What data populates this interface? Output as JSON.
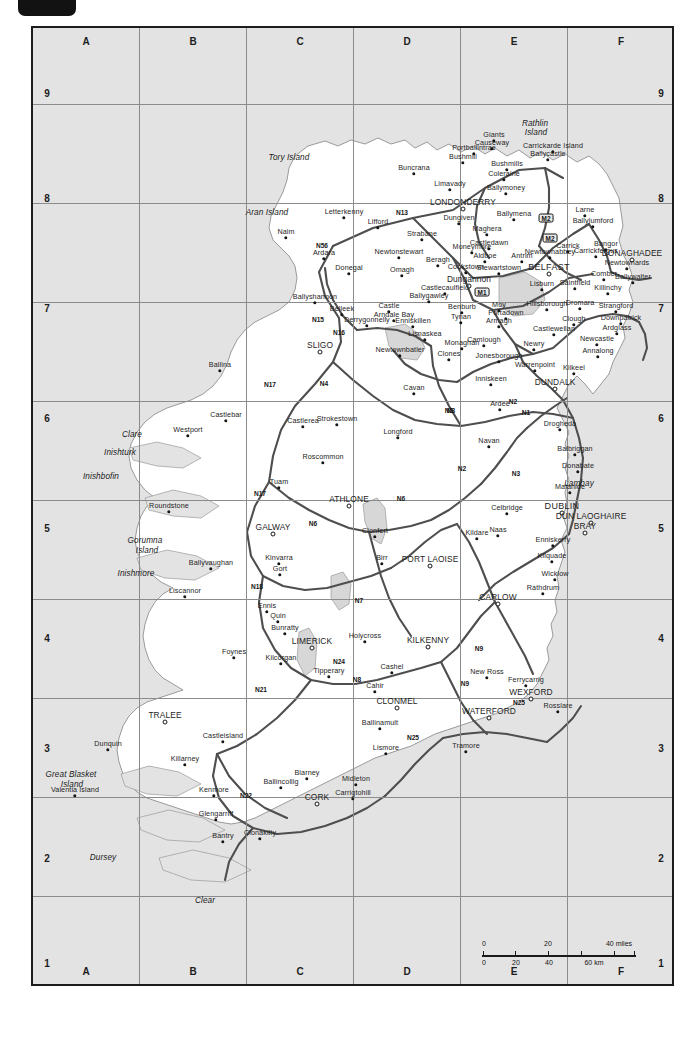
{
  "map": {
    "title": "Ireland road map",
    "sea_color": "#e3e3e3",
    "land_color": "#ffffff",
    "road_color": "#4a4a4a",
    "frame_color": "#1c1c1c",
    "grid": {
      "columns": [
        "A",
        "B",
        "C",
        "D",
        "E",
        "F"
      ],
      "rows": [
        "9",
        "8",
        "7",
        "6",
        "5",
        "4",
        "3",
        "2",
        "1"
      ]
    },
    "scale": {
      "miles_label": "40 miles",
      "miles_ticks": [
        "0",
        "20",
        "40 miles"
      ],
      "km_ticks": [
        "0",
        "20",
        "40",
        "60 km"
      ],
      "km_label": "60 km"
    },
    "places": [
      {
        "name": "Tory Island",
        "x": 287,
        "y": 155,
        "type": "water"
      },
      {
        "name": "Aran Island",
        "x": 265,
        "y": 210,
        "type": "water"
      },
      {
        "name": "Naim",
        "x": 284,
        "y": 236,
        "type": "town"
      },
      {
        "name": "Ardara",
        "x": 322,
        "y": 257,
        "type": "town"
      },
      {
        "name": "Letterkenny",
        "x": 342,
        "y": 216,
        "type": "town"
      },
      {
        "name": "Lifford",
        "x": 376,
        "y": 226,
        "type": "town"
      },
      {
        "name": "Strabane",
        "x": 420,
        "y": 238,
        "type": "town"
      },
      {
        "name": "Buncrana",
        "x": 412,
        "y": 172,
        "type": "town"
      },
      {
        "name": "Limavady",
        "x": 448,
        "y": 188,
        "type": "town"
      },
      {
        "name": "LONDONDERRY",
        "x": 461,
        "y": 207,
        "type": "city"
      },
      {
        "name": "Dungiven",
        "x": 457,
        "y": 222,
        "type": "town"
      },
      {
        "name": "Coleraine",
        "x": 502,
        "y": 178,
        "type": "town"
      },
      {
        "name": "Bushmills",
        "x": 505,
        "y": 168,
        "type": "town"
      },
      {
        "name": "Portballintrae",
        "x": 472,
        "y": 152,
        "type": "town"
      },
      {
        "name": "Bushmill",
        "x": 461,
        "y": 161,
        "type": "town"
      },
      {
        "name": "Giants",
        "x": 492,
        "y": 139,
        "type": "town"
      },
      {
        "name": "Causeway",
        "x": 490,
        "y": 147,
        "type": "town"
      },
      {
        "name": "Carrickarde Island",
        "x": 551,
        "y": 150,
        "type": "town"
      },
      {
        "name": "Ballycastle",
        "x": 546,
        "y": 158,
        "type": "town"
      },
      {
        "name": "Rathlin",
        "x": 533,
        "y": 121,
        "type": "water"
      },
      {
        "name": "Island",
        "x": 534,
        "y": 130,
        "type": "water"
      },
      {
        "name": "Ballymoney",
        "x": 504,
        "y": 192,
        "type": "town"
      },
      {
        "name": "Ballymena",
        "x": 512,
        "y": 218,
        "type": "town"
      },
      {
        "name": "Maghera",
        "x": 485,
        "y": 233,
        "type": "town"
      },
      {
        "name": "Moneymore",
        "x": 470,
        "y": 251,
        "type": "town"
      },
      {
        "name": "Cookstown",
        "x": 464,
        "y": 271,
        "type": "town"
      },
      {
        "name": "Castledawn",
        "x": 487,
        "y": 247,
        "type": "town"
      },
      {
        "name": "Aldboe",
        "x": 483,
        "y": 260,
        "type": "town"
      },
      {
        "name": "Stewartstown",
        "x": 497,
        "y": 272,
        "type": "town"
      },
      {
        "name": "Dungannon",
        "x": 467,
        "y": 284,
        "type": "city"
      },
      {
        "name": "Castlecaulfield",
        "x": 443,
        "y": 292,
        "type": "town"
      },
      {
        "name": "Ballygawley",
        "x": 427,
        "y": 300,
        "type": "town"
      },
      {
        "name": "Newtonstewart",
        "x": 397,
        "y": 256,
        "type": "town"
      },
      {
        "name": "Omagh",
        "x": 400,
        "y": 274,
        "type": "town"
      },
      {
        "name": "Beragh",
        "x": 436,
        "y": 264,
        "type": "town"
      },
      {
        "name": "Benburb",
        "x": 460,
        "y": 311,
        "type": "town"
      },
      {
        "name": "Tynan",
        "x": 459,
        "y": 321,
        "type": "town"
      },
      {
        "name": "Moy",
        "x": 497,
        "y": 309,
        "type": "town"
      },
      {
        "name": "Portadown",
        "x": 504,
        "y": 317,
        "type": "town"
      },
      {
        "name": "Armagh",
        "x": 497,
        "y": 325,
        "type": "town"
      },
      {
        "name": "Hillsborough",
        "x": 545,
        "y": 308,
        "type": "town"
      },
      {
        "name": "Lisburn",
        "x": 540,
        "y": 288,
        "type": "town"
      },
      {
        "name": "BELFAST",
        "x": 547,
        "y": 272,
        "type": "capital"
      },
      {
        "name": "Antrim",
        "x": 520,
        "y": 260,
        "type": "town"
      },
      {
        "name": "Newtownabbey",
        "x": 548,
        "y": 256,
        "type": "town"
      },
      {
        "name": "Carrick",
        "x": 566,
        "y": 250,
        "type": "town"
      },
      {
        "name": "Carrickfergus",
        "x": 594,
        "y": 255,
        "type": "town"
      },
      {
        "name": "Larne",
        "x": 583,
        "y": 214,
        "type": "town"
      },
      {
        "name": "Ballylumford",
        "x": 591,
        "y": 225,
        "type": "town"
      },
      {
        "name": "Bangor",
        "x": 604,
        "y": 248,
        "type": "town"
      },
      {
        "name": "DONAGHADEE",
        "x": 630,
        "y": 258,
        "type": "city"
      },
      {
        "name": "Newtownards",
        "x": 625,
        "y": 267,
        "type": "town"
      },
      {
        "name": "Comber",
        "x": 602,
        "y": 278,
        "type": "town"
      },
      {
        "name": "Ballywalter",
        "x": 631,
        "y": 281,
        "type": "town"
      },
      {
        "name": "Killinchy",
        "x": 606,
        "y": 292,
        "type": "town"
      },
      {
        "name": "Saintfield",
        "x": 573,
        "y": 287,
        "type": "town"
      },
      {
        "name": "Dromara",
        "x": 578,
        "y": 307,
        "type": "town"
      },
      {
        "name": "Strangford",
        "x": 614,
        "y": 310,
        "type": "town"
      },
      {
        "name": "Downpatrick",
        "x": 619,
        "y": 322,
        "type": "town"
      },
      {
        "name": "Ardglass",
        "x": 615,
        "y": 332,
        "type": "town"
      },
      {
        "name": "Clough",
        "x": 572,
        "y": 323,
        "type": "town"
      },
      {
        "name": "Castlewellan",
        "x": 552,
        "y": 333,
        "type": "town"
      },
      {
        "name": "Newcastle",
        "x": 595,
        "y": 343,
        "type": "town"
      },
      {
        "name": "Annalong",
        "x": 596,
        "y": 355,
        "type": "town"
      },
      {
        "name": "Kilkeel",
        "x": 572,
        "y": 372,
        "type": "town"
      },
      {
        "name": "Warrenpoint",
        "x": 533,
        "y": 369,
        "type": "town"
      },
      {
        "name": "Newry",
        "x": 532,
        "y": 348,
        "type": "town"
      },
      {
        "name": "Camlough",
        "x": 482,
        "y": 344,
        "type": "town"
      },
      {
        "name": "Jonesborough",
        "x": 497,
        "y": 360,
        "type": "town"
      },
      {
        "name": "Monaghan",
        "x": 460,
        "y": 347,
        "type": "town"
      },
      {
        "name": "Clones",
        "x": 447,
        "y": 358,
        "type": "town"
      },
      {
        "name": "Newtownbatler",
        "x": 398,
        "y": 354,
        "type": "town"
      },
      {
        "name": "Lisnaskea",
        "x": 423,
        "y": 338,
        "type": "town"
      },
      {
        "name": "Enniskillen",
        "x": 411,
        "y": 325,
        "type": "town"
      },
      {
        "name": "Castle",
        "x": 387,
        "y": 310,
        "type": "town"
      },
      {
        "name": "Arndale Bay",
        "x": 392,
        "y": 319,
        "type": "town"
      },
      {
        "name": "Derrygonnelly",
        "x": 365,
        "y": 324,
        "type": "town"
      },
      {
        "name": "Belleek",
        "x": 340,
        "y": 313,
        "type": "town"
      },
      {
        "name": "Ballyshannon",
        "x": 313,
        "y": 301,
        "type": "town"
      },
      {
        "name": "Donegal",
        "x": 347,
        "y": 272,
        "type": "town"
      },
      {
        "name": "SLIGO",
        "x": 318,
        "y": 350,
        "type": "city"
      },
      {
        "name": "Inniskeen",
        "x": 489,
        "y": 383,
        "type": "town"
      },
      {
        "name": "DUNDALK",
        "x": 553,
        "y": 387,
        "type": "city"
      },
      {
        "name": "Ardee",
        "x": 498,
        "y": 408,
        "type": "town"
      },
      {
        "name": "Cavan",
        "x": 412,
        "y": 392,
        "type": "town"
      },
      {
        "name": "Drogheda",
        "x": 558,
        "y": 428,
        "type": "town"
      },
      {
        "name": "Navan",
        "x": 487,
        "y": 445,
        "type": "town"
      },
      {
        "name": "Longford",
        "x": 396,
        "y": 436,
        "type": "town"
      },
      {
        "name": "Strokestown",
        "x": 335,
        "y": 423,
        "type": "town"
      },
      {
        "name": "Castlerea",
        "x": 301,
        "y": 425,
        "type": "town"
      },
      {
        "name": "Roscommon",
        "x": 321,
        "y": 461,
        "type": "town"
      },
      {
        "name": "Castlebar",
        "x": 224,
        "y": 419,
        "type": "town"
      },
      {
        "name": "Ballina",
        "x": 218,
        "y": 369,
        "type": "town"
      },
      {
        "name": "Westport",
        "x": 186,
        "y": 434,
        "type": "town"
      },
      {
        "name": "Clare",
        "x": 130,
        "y": 432,
        "type": "water"
      },
      {
        "name": "Inishturk",
        "x": 118,
        "y": 450,
        "type": "water"
      },
      {
        "name": "Inishbofin",
        "x": 99,
        "y": 474,
        "type": "water"
      },
      {
        "name": "Roundstone",
        "x": 167,
        "y": 510,
        "type": "town"
      },
      {
        "name": "Gorumna",
        "x": 143,
        "y": 538,
        "type": "water"
      },
      {
        "name": "Island",
        "x": 145,
        "y": 548,
        "type": "water"
      },
      {
        "name": "Inishmore",
        "x": 134,
        "y": 571,
        "type": "water"
      },
      {
        "name": "Ballyvaughan",
        "x": 209,
        "y": 567,
        "type": "town"
      },
      {
        "name": "Liscannor",
        "x": 183,
        "y": 595,
        "type": "town"
      },
      {
        "name": "GALWAY",
        "x": 271,
        "y": 532,
        "type": "city"
      },
      {
        "name": "Tuam",
        "x": 277,
        "y": 486,
        "type": "town"
      },
      {
        "name": "Kinvarra",
        "x": 277,
        "y": 562,
        "type": "town"
      },
      {
        "name": "Gort",
        "x": 278,
        "y": 573,
        "type": "town"
      },
      {
        "name": "ATHLONE",
        "x": 347,
        "y": 504,
        "type": "city"
      },
      {
        "name": "Clonfert",
        "x": 373,
        "y": 535,
        "type": "town"
      },
      {
        "name": "Birr",
        "x": 380,
        "y": 562,
        "type": "town"
      },
      {
        "name": "PORT LAOISE",
        "x": 428,
        "y": 564,
        "type": "city"
      },
      {
        "name": "Kildare",
        "x": 475,
        "y": 537,
        "type": "town"
      },
      {
        "name": "Celbridge",
        "x": 505,
        "y": 512,
        "type": "town"
      },
      {
        "name": "DUBLIN",
        "x": 560,
        "y": 511,
        "type": "capital"
      },
      {
        "name": "DUN LAOGHAIRE",
        "x": 589,
        "y": 521,
        "type": "city"
      },
      {
        "name": "BRAY",
        "x": 583,
        "y": 531,
        "type": "city"
      },
      {
        "name": "Malahide",
        "x": 568,
        "y": 491,
        "type": "town"
      },
      {
        "name": "Lambay",
        "x": 577,
        "y": 481,
        "type": "water"
      },
      {
        "name": "Donabate",
        "x": 576,
        "y": 470,
        "type": "town"
      },
      {
        "name": "Balbriggan",
        "x": 573,
        "y": 453,
        "type": "town"
      },
      {
        "name": "Naas",
        "x": 496,
        "y": 534,
        "type": "town"
      },
      {
        "name": "Enniskerry",
        "x": 551,
        "y": 544,
        "type": "town"
      },
      {
        "name": "Kilquade",
        "x": 550,
        "y": 560,
        "type": "town"
      },
      {
        "name": "Wicklow",
        "x": 553,
        "y": 578,
        "type": "town"
      },
      {
        "name": "Rathdrum",
        "x": 541,
        "y": 592,
        "type": "town"
      },
      {
        "name": "CARLOW",
        "x": 496,
        "y": 602,
        "type": "city"
      },
      {
        "name": "KILKENNY",
        "x": 426,
        "y": 645,
        "type": "city"
      },
      {
        "name": "Holycross",
        "x": 363,
        "y": 640,
        "type": "town"
      },
      {
        "name": "LIMERICK",
        "x": 310,
        "y": 646,
        "type": "city"
      },
      {
        "name": "Ennis",
        "x": 265,
        "y": 610,
        "type": "town"
      },
      {
        "name": "Quin",
        "x": 276,
        "y": 620,
        "type": "town"
      },
      {
        "name": "Bunratty",
        "x": 283,
        "y": 632,
        "type": "town"
      },
      {
        "name": "Foynes",
        "x": 232,
        "y": 656,
        "type": "town"
      },
      {
        "name": "Kilcorgan",
        "x": 279,
        "y": 662,
        "type": "town"
      },
      {
        "name": "Tipperary",
        "x": 327,
        "y": 675,
        "type": "town"
      },
      {
        "name": "Cashel",
        "x": 390,
        "y": 671,
        "type": "town"
      },
      {
        "name": "Cahir",
        "x": 373,
        "y": 690,
        "type": "town"
      },
      {
        "name": "CLONMEL",
        "x": 395,
        "y": 706,
        "type": "city"
      },
      {
        "name": "Ballinamult",
        "x": 378,
        "y": 727,
        "type": "town"
      },
      {
        "name": "Lismore",
        "x": 384,
        "y": 752,
        "type": "town"
      },
      {
        "name": "New Ross",
        "x": 485,
        "y": 676,
        "type": "town"
      },
      {
        "name": "Ferrycarrig",
        "x": 524,
        "y": 684,
        "type": "town"
      },
      {
        "name": "WEXFORD",
        "x": 529,
        "y": 697,
        "type": "city"
      },
      {
        "name": "Rosslare",
        "x": 556,
        "y": 710,
        "type": "town"
      },
      {
        "name": "WATERFORD",
        "x": 487,
        "y": 716,
        "type": "city"
      },
      {
        "name": "Tramore",
        "x": 464,
        "y": 750,
        "type": "town"
      },
      {
        "name": "TRALEE",
        "x": 163,
        "y": 720,
        "type": "city"
      },
      {
        "name": "Castleisland",
        "x": 221,
        "y": 740,
        "type": "town"
      },
      {
        "name": "Killarney",
        "x": 183,
        "y": 763,
        "type": "town"
      },
      {
        "name": "Dunquin",
        "x": 106,
        "y": 748,
        "type": "town"
      },
      {
        "name": "Great Blasket",
        "x": 69,
        "y": 772,
        "type": "water"
      },
      {
        "name": "Island",
        "x": 70,
        "y": 782,
        "type": "water"
      },
      {
        "name": "Valentia Island",
        "x": 73,
        "y": 794,
        "type": "town"
      },
      {
        "name": "Kenmore",
        "x": 212,
        "y": 794,
        "type": "town"
      },
      {
        "name": "Ballincollig",
        "x": 279,
        "y": 786,
        "type": "town"
      },
      {
        "name": "Blarney",
        "x": 305,
        "y": 777,
        "type": "town"
      },
      {
        "name": "CORK",
        "x": 315,
        "y": 802,
        "type": "city"
      },
      {
        "name": "Carrigtohill",
        "x": 351,
        "y": 797,
        "type": "town"
      },
      {
        "name": "Midleton",
        "x": 354,
        "y": 783,
        "type": "town"
      },
      {
        "name": "Glengarriff",
        "x": 214,
        "y": 818,
        "type": "town"
      },
      {
        "name": "Bantry",
        "x": 221,
        "y": 840,
        "type": "town"
      },
      {
        "name": "Clonakilty",
        "x": 258,
        "y": 837,
        "type": "town"
      },
      {
        "name": "Dursey",
        "x": 101,
        "y": 855,
        "type": "water"
      },
      {
        "name": "Clear",
        "x": 203,
        "y": 898,
        "type": "water"
      }
    ],
    "road_labels": [
      {
        "label": "N13",
        "x": 400,
        "y": 210
      },
      {
        "label": "N56",
        "x": 320,
        "y": 243
      },
      {
        "label": "N15",
        "x": 316,
        "y": 317
      },
      {
        "label": "N16",
        "x": 337,
        "y": 330
      },
      {
        "label": "N17",
        "x": 268,
        "y": 382
      },
      {
        "label": "N4",
        "x": 322,
        "y": 381
      },
      {
        "label": "N5",
        "x": 447,
        "y": 408
      },
      {
        "label": "N3",
        "x": 449,
        "y": 408
      },
      {
        "label": "N2",
        "x": 511,
        "y": 399
      },
      {
        "label": "N1",
        "x": 524,
        "y": 410
      },
      {
        "label": "N17",
        "x": 258,
        "y": 491
      },
      {
        "label": "N6",
        "x": 399,
        "y": 496
      },
      {
        "label": "N6",
        "x": 311,
        "y": 521
      },
      {
        "label": "N2",
        "x": 460,
        "y": 466
      },
      {
        "label": "N3",
        "x": 514,
        "y": 471
      },
      {
        "label": "N18",
        "x": 255,
        "y": 584
      },
      {
        "label": "N7",
        "x": 357,
        "y": 598
      },
      {
        "label": "N24",
        "x": 337,
        "y": 659
      },
      {
        "label": "N21",
        "x": 259,
        "y": 687
      },
      {
        "label": "N8",
        "x": 355,
        "y": 677
      },
      {
        "label": "N9",
        "x": 463,
        "y": 681
      },
      {
        "label": "N9",
        "x": 477,
        "y": 646
      },
      {
        "label": "N25",
        "x": 411,
        "y": 735
      },
      {
        "label": "N25",
        "x": 517,
        "y": 700
      },
      {
        "label": "N22",
        "x": 244,
        "y": 793
      }
    ],
    "motorways": [
      {
        "label": "M2",
        "x": 544,
        "y": 216
      },
      {
        "label": "M2",
        "x": 548,
        "y": 236
      },
      {
        "label": "M1",
        "x": 480,
        "y": 290
      }
    ]
  }
}
